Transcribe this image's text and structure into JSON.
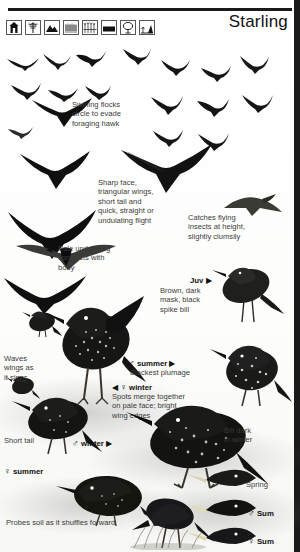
{
  "header": {
    "title": "Starling",
    "habitat_icons": [
      {
        "name": "building-icon",
        "label": "buildings"
      },
      {
        "name": "tree-icon",
        "label": "trees"
      },
      {
        "name": "mountain-icon",
        "label": "upland"
      },
      {
        "name": "reedbed-icon",
        "label": "reedbed"
      },
      {
        "name": "grassland-icon",
        "label": "grassland"
      },
      {
        "name": "field-icon",
        "label": "open field"
      },
      {
        "name": "park-tree-icon",
        "label": "parkland"
      },
      {
        "name": "woodland-edge-icon",
        "label": "woodland edge"
      }
    ]
  },
  "annotations": {
    "flock": "Swirling flocks\ncircle to evade\nforaging hawk",
    "flight": "Sharp face,\ntriangular wings,\nshort tail and\nquick, straight or\nundulating flight",
    "catches": "Catches flying\ninsects at height,\nslightly clumsily",
    "underwing": "Pale underwing\ncontrasts with\nbody",
    "juvenile": "Brown, dark\nmask, black\nspike bill",
    "male_summer_desc": "Blackest plumage",
    "female_winter_desc": "Spots merge together\non pale face; bright\nwing edges",
    "waves": "Waves\nwings as\nit sings",
    "short_tail": "Short tail",
    "bill_dark": "Bill dark\nin winter",
    "probes": "Probes soil as it shuffles forward"
  },
  "labels": {
    "juv": "Juv",
    "male_summer": "summer",
    "female_winter": "winter",
    "male_winter": "winter",
    "female_summer": "summer",
    "spring": "Spring",
    "male_sum": "Sum",
    "female_sum": "Sum",
    "male_symbol": "♂",
    "female_symbol": "♀",
    "arrow_right": "▶",
    "arrow_left": "◀"
  }
}
